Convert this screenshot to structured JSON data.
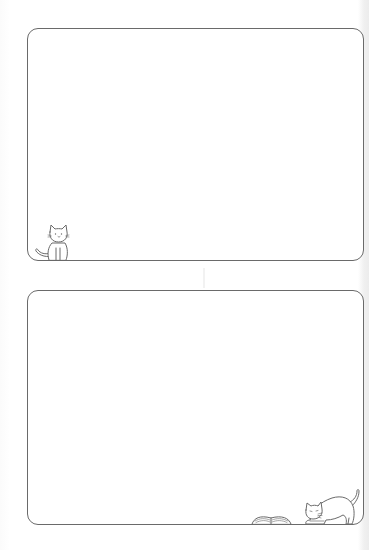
{
  "page": {
    "type": "printable-note-template",
    "background_color": "#ffffff",
    "frame_stroke_color": "#6a6a6a"
  },
  "frames": [
    {
      "id": "frame-top",
      "content": "",
      "decorations": [
        {
          "icon": "sitting-cat-icon",
          "position": "bottom-left"
        }
      ]
    },
    {
      "id": "frame-bottom",
      "content": "",
      "decorations": [
        {
          "icon": "open-book-icon",
          "position": "bottom-right"
        },
        {
          "icon": "stretching-cat-icon",
          "position": "bottom-right"
        }
      ]
    }
  ]
}
